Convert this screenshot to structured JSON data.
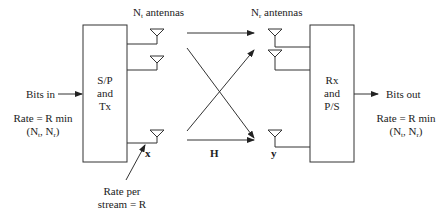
{
  "diagram": {
    "type": "MIMO system block diagram",
    "tx_antennas_label": {
      "prefix": "N",
      "sub": "t",
      "suffix": " antennas"
    },
    "rx_antennas_label": {
      "prefix": "N",
      "sub": "r",
      "suffix": " antennas"
    },
    "tx_block": {
      "line1": "S/P",
      "line2": "and",
      "line3": "Tx"
    },
    "rx_block": {
      "line1": "Rx",
      "line2": "and",
      "line3": "P/S"
    },
    "input_label": "Bits in",
    "output_label": "Bits out",
    "input_rate": {
      "line1": "Rate = R min",
      "open": "(N",
      "sub1": "t",
      "mid": ", N",
      "sub2": "r",
      "close": ")"
    },
    "output_rate": {
      "line1": "Rate = R min",
      "open": "(N",
      "sub1": "t",
      "mid": ", N",
      "sub2": "r",
      "close": ")"
    },
    "tx_vector_label": "x",
    "channel_label": "H",
    "rx_vector_label": "y",
    "stream_rate": {
      "line1": "Rate per",
      "line2": "stream = R"
    },
    "line_color": "#333333"
  }
}
